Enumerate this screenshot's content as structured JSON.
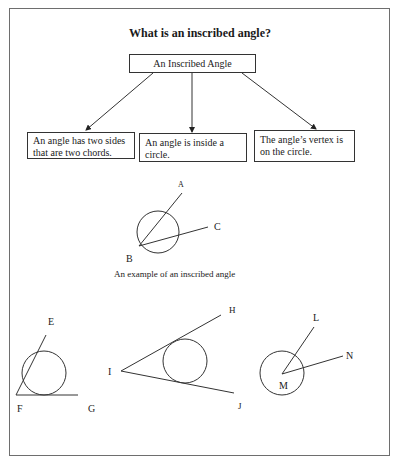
{
  "title": "What is an inscribed angle?",
  "diagram": {
    "root": "An Inscribed Angle",
    "children": [
      {
        "text": "An angle has two sides that are two chords."
      },
      {
        "text": "An angle is inside a circle."
      },
      {
        "text": "The angle’s vertex is on the circle."
      }
    ]
  },
  "example": {
    "caption": "An example of an inscribed angle",
    "labels": {
      "vertex": "B",
      "ray1": "A",
      "ray2": "C"
    }
  },
  "figures": [
    {
      "name": "tangent-chord",
      "labels": {
        "ray1": "E",
        "vertex": "F",
        "ray2": "G"
      }
    },
    {
      "name": "two-tangents",
      "labels": {
        "ray1": "H",
        "vertex": "I",
        "ray2": "J"
      }
    },
    {
      "name": "central-angle",
      "labels": {
        "ray1": "L",
        "vertex": "M",
        "ray2": "N"
      }
    }
  ]
}
